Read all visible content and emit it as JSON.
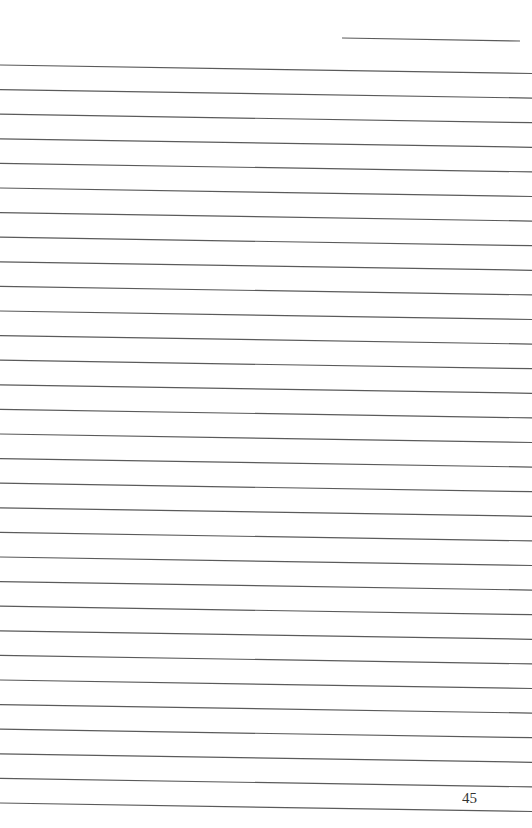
{
  "page": {
    "type": "lined-notebook-page",
    "page_number": "45",
    "line_color": "#5a5a5a",
    "header_line": {
      "x1": 342,
      "y1": 38,
      "x2": 520,
      "y2": 41
    },
    "ruled_lines": {
      "count": 31,
      "start_y_left": 65,
      "spacing": 24.6,
      "slope_drop": 8.5,
      "x_start": 0,
      "x_end": 532
    }
  }
}
